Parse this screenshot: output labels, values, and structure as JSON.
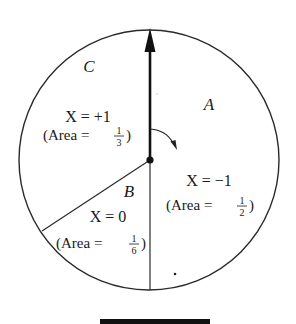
{
  "diagram": {
    "type": "spinner",
    "circle": {
      "cx": 150,
      "cy": 160,
      "r": 130,
      "stroke": "#2a2a2a"
    },
    "pointer": {
      "direction": "up",
      "label": "spinner-arrow"
    },
    "rotation_hint": "clockwise",
    "regions": [
      {
        "letter": "A",
        "variable": "X",
        "value_text": "X = −1",
        "area_prefix": "(Area = ",
        "area_num": "1",
        "area_den": "2",
        "area_suffix": ")"
      },
      {
        "letter": "B",
        "variable": "X",
        "value_text": "X = 0",
        "area_prefix": "(Area = ",
        "area_num": "1",
        "area_den": "6",
        "area_suffix": ")"
      },
      {
        "letter": "C",
        "variable": "X",
        "value_text": "X = +1",
        "area_prefix": "(Area = ",
        "area_num": "1",
        "area_den": "3",
        "area_suffix": ")"
      }
    ]
  }
}
